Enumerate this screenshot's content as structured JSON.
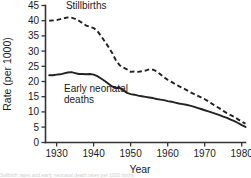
{
  "chart_data": {
    "type": "line",
    "title": "",
    "xlabel": "Year",
    "ylabel": "Rate (per 1000)",
    "xlim": [
      1927,
      1981
    ],
    "ylim": [
      0,
      45
    ],
    "xticks": [
      1930,
      1940,
      1950,
      1960,
      1970,
      1980
    ],
    "xticklabels": [
      "1930",
      "1940",
      "1950",
      "1960",
      "1970",
      "1980"
    ],
    "yticks": [
      0,
      5,
      10,
      15,
      20,
      25,
      30,
      35,
      40,
      45
    ],
    "yticklabels": [
      "0",
      "5",
      "10",
      "15",
      "20",
      "25",
      "30",
      "35",
      "40",
      "45"
    ],
    "grid": false,
    "legend_position": "inline-annotations",
    "series": [
      {
        "name": "Stillbirths",
        "style": "dashed",
        "color": "#222222",
        "label_text": "Stillbirths",
        "label_x": 1932.5,
        "label_y": 44.0,
        "x": [
          1928,
          1929,
          1930,
          1931,
          1932,
          1933,
          1934,
          1935,
          1936,
          1937,
          1938,
          1939,
          1940,
          1941,
          1942,
          1943,
          1944,
          1945,
          1946,
          1947,
          1948,
          1949,
          1950,
          1951,
          1952,
          1953,
          1954,
          1955,
          1956,
          1957,
          1958,
          1959,
          1960,
          1961,
          1962,
          1963,
          1964,
          1965,
          1966,
          1967,
          1968,
          1969,
          1970,
          1971,
          1972,
          1973,
          1974,
          1975,
          1976,
          1977,
          1978,
          1979,
          1980,
          1981
        ],
        "values": [
          40.0,
          40.1,
          40.2,
          40.5,
          40.8,
          41.1,
          41.0,
          40.6,
          40.0,
          39.2,
          38.4,
          38.0,
          37.6,
          36.6,
          35.0,
          33.2,
          31.4,
          29.4,
          27.0,
          25.4,
          24.6,
          24.0,
          23.2,
          23.3,
          23.2,
          23.4,
          23.6,
          24.0,
          23.9,
          23.4,
          22.4,
          21.4,
          20.6,
          19.9,
          19.2,
          18.5,
          17.9,
          17.3,
          16.6,
          16.0,
          15.4,
          14.8,
          14.2,
          13.5,
          12.7,
          11.9,
          11.2,
          10.4,
          9.6,
          9.0,
          8.4,
          7.6,
          6.8,
          6.2
        ]
      },
      {
        "name": "Early neonatal deaths",
        "style": "solid",
        "color": "#222222",
        "label_text": "Early neonatal",
        "label_text2": "deaths",
        "label_x": 1932.0,
        "label_y": 16.5,
        "x": [
          1928,
          1929,
          1930,
          1931,
          1932,
          1933,
          1934,
          1935,
          1936,
          1937,
          1938,
          1939,
          1940,
          1941,
          1942,
          1943,
          1944,
          1945,
          1946,
          1947,
          1948,
          1949,
          1950,
          1951,
          1952,
          1953,
          1954,
          1955,
          1956,
          1957,
          1958,
          1959,
          1960,
          1961,
          1962,
          1963,
          1964,
          1965,
          1966,
          1967,
          1968,
          1969,
          1970,
          1971,
          1972,
          1973,
          1974,
          1975,
          1976,
          1977,
          1978,
          1979,
          1980,
          1981
        ],
        "values": [
          22.1,
          22.1,
          22.3,
          22.4,
          22.7,
          23.0,
          23.1,
          22.8,
          22.5,
          22.5,
          22.4,
          22.5,
          22.3,
          21.8,
          21.0,
          20.2,
          19.3,
          18.4,
          17.9,
          18.0,
          17.2,
          16.3,
          15.9,
          15.7,
          15.4,
          15.2,
          15.0,
          14.8,
          14.6,
          14.3,
          14.1,
          13.9,
          13.6,
          13.4,
          13.1,
          12.8,
          12.6,
          12.4,
          12.1,
          11.8,
          11.4,
          11.0,
          10.6,
          10.2,
          9.8,
          9.4,
          9.0,
          8.5,
          8.1,
          7.5,
          7.0,
          6.4,
          5.7,
          5.1
        ]
      }
    ]
  },
  "caption": {
    "sliver_text": "Stillbirth rates and early neonatal death rates per 1000 births"
  }
}
